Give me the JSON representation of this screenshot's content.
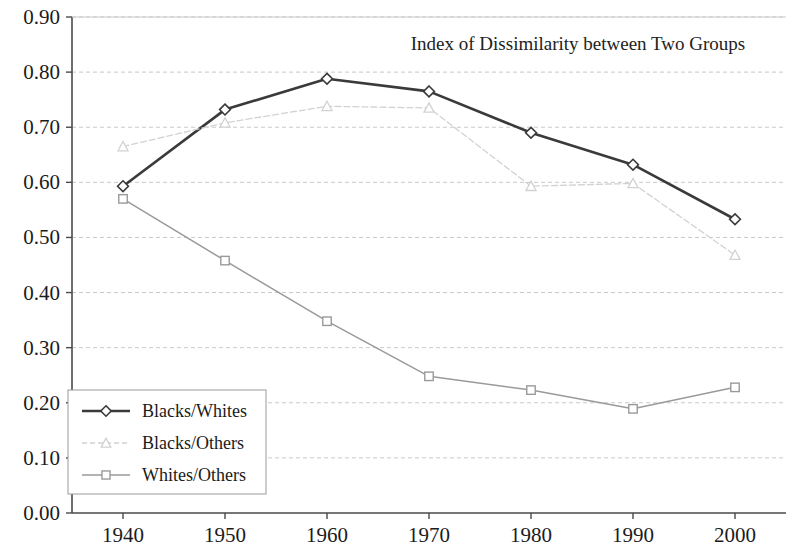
{
  "chart_data": {
    "type": "line",
    "title": "Index of Dissimilarity between Two Groups",
    "xlabel": "",
    "ylabel": "",
    "x": [
      1940,
      1950,
      1960,
      1970,
      1980,
      1990,
      2000
    ],
    "categories": [
      "1940",
      "1950",
      "1960",
      "1970",
      "1980",
      "1990",
      "2000"
    ],
    "xlim": [
      1935,
      2005
    ],
    "ylim": [
      0.0,
      0.9
    ],
    "ytick_labels": [
      "0.00",
      "0.10",
      "0.20",
      "0.30",
      "0.40",
      "0.50",
      "0.60",
      "0.70",
      "0.80",
      "0.90"
    ],
    "ytick_values": [
      0.0,
      0.1,
      0.2,
      0.3,
      0.4,
      0.5,
      0.6,
      0.7,
      0.8,
      0.9
    ],
    "xtick_labels": [
      "1940",
      "1950",
      "1960",
      "1970",
      "1980",
      "1990",
      "2000"
    ],
    "grid": true,
    "grid_axis": "y",
    "grid_style": "dashed",
    "legend_position": "lower left",
    "series": [
      {
        "name": "Blacks/Whites",
        "marker": "diamond",
        "color": "#3a3a3a",
        "line_style": "solid",
        "values": [
          0.593,
          0.732,
          0.788,
          0.765,
          0.69,
          0.632,
          0.533
        ]
      },
      {
        "name": "Blacks/Others",
        "marker": "triangle",
        "color": "#d2d2d2",
        "line_style": "dashed",
        "values": [
          0.665,
          0.708,
          0.738,
          0.735,
          0.593,
          0.598,
          0.468
        ]
      },
      {
        "name": "Whites/Others",
        "marker": "square",
        "color": "#9a9a9a",
        "line_style": "solid",
        "values": [
          0.57,
          0.458,
          0.348,
          0.248,
          0.223,
          0.189,
          0.228
        ]
      }
    ]
  },
  "colors": {
    "axis": "#4a4a4a",
    "grid": "#c9c9c9",
    "background": "#ffffff",
    "text": "#1b1b1b",
    "series_blacks_whites": "#3a3a3a",
    "series_blacks_others": "#d2d2d2",
    "series_whites_others": "#9a9a9a"
  },
  "legend": {
    "items": [
      {
        "label": "Blacks/Whites"
      },
      {
        "label": "Blacks/Others"
      },
      {
        "label": "Whites/Others"
      }
    ]
  }
}
